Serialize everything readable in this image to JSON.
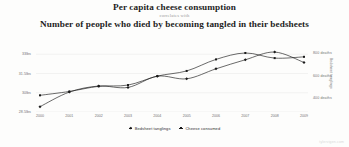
{
  "title": {
    "primary": "Per capita cheese consumption",
    "connector": "correlates with",
    "secondary": "Number of people who died by becoming tangled in their bedsheets"
  },
  "watermark": "tylervigen.com",
  "legend": {
    "position": "bottom-center",
    "entries": [
      {
        "label": "Bedsheet tanglings",
        "marker": "diamond",
        "color": "#1a1a1a"
      },
      {
        "label": "Cheese consumed",
        "marker": "square",
        "color": "#1a1a1a"
      }
    ]
  },
  "chart_data": {
    "type": "line",
    "title": "Per capita cheese consumption correlates with Number of people who died by becoming tangled in their bedsheets",
    "xlabel": "",
    "x": [
      2000,
      2001,
      2002,
      2003,
      2004,
      2005,
      2006,
      2007,
      2008,
      2009
    ],
    "xticklabels": [
      "2000",
      "2001",
      "2002",
      "2003",
      "2004",
      "2005",
      "2006",
      "2007",
      "2008",
      "2009"
    ],
    "grid": true,
    "axes": [
      {
        "id": "left",
        "ylabel": "Cheese consumed",
        "ylim": [
          28.5,
          33.8
        ],
        "yticks": [
          28.5,
          30,
          31.5,
          33
        ],
        "yticklabels": [
          "28.5lbs",
          "30lbs",
          "31.5lbs",
          "33lbs"
        ]
      },
      {
        "id": "right",
        "ylabel": "Bedsheet tanglings",
        "ylim": [
          280,
          880
        ],
        "yticks": [
          400,
          600,
          800
        ],
        "yticklabels": [
          "400 deaths",
          "600 deaths",
          "800 deaths"
        ]
      }
    ],
    "series": [
      {
        "name": "Cheese consumed",
        "axis": "left",
        "units": "lbs",
        "marker": "square",
        "color": "#1a1a1a",
        "values": [
          29.8,
          30.1,
          30.5,
          30.6,
          31.3,
          31.7,
          32.6,
          33.1,
          32.7,
          32.8
        ]
      },
      {
        "name": "Bedsheet tanglings",
        "axis": "right",
        "units": "deaths",
        "marker": "diamond",
        "color": "#1a1a1a",
        "values": [
          327,
          456,
          509,
          497,
          596,
          573,
          661,
          741,
          809,
          717
        ]
      }
    ]
  }
}
